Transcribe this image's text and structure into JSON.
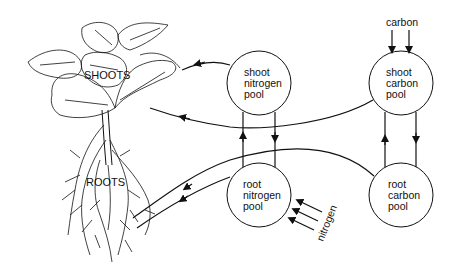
{
  "diagram": {
    "plant_labels": {
      "shoots": "SHOOTS",
      "roots": "ROOTS"
    },
    "pools": [
      {
        "id": "shoot-nitrogen",
        "lines": [
          "shoot",
          "nitrogen",
          "pool"
        ]
      },
      {
        "id": "shoot-carbon",
        "lines": [
          "shoot",
          "carbon",
          "pool"
        ]
      },
      {
        "id": "root-nitrogen",
        "lines": [
          "root",
          "nitrogen",
          "pool"
        ]
      },
      {
        "id": "root-carbon",
        "lines": [
          "root",
          "carbon",
          "pool"
        ]
      }
    ],
    "inputs": {
      "carbon": "carbon",
      "nitrogen": "nitrogen"
    },
    "colors": {
      "line": "#111111",
      "background": "#ffffff"
    }
  }
}
